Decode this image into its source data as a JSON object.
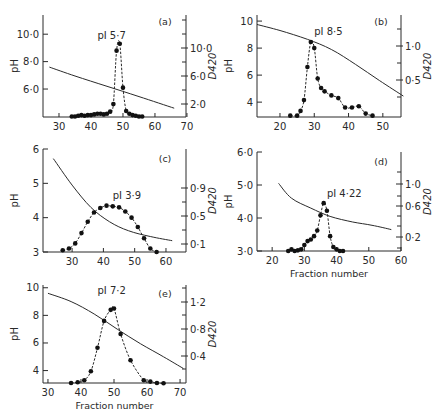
{
  "figure": {
    "background": "#ffffff",
    "ink": "#2a2a2a"
  },
  "chart_data": [
    {
      "type": "line",
      "panel": "(a)",
      "annotation": "pI 5·7",
      "xlabel": "",
      "ylabel": "pH",
      "ylabel_right": "D420",
      "x_ticks": [
        "30",
        "40",
        "50",
        "60",
        "70"
      ],
      "y_ticks": [
        "6·0",
        "8·0",
        "10·0"
      ],
      "y_right_ticks": [
        "2·0",
        "6·0",
        "10·0"
      ],
      "geom": {
        "left": 43,
        "right": 186,
        "top": 15,
        "bottom": 117,
        "x0": 25,
        "x1": 69.7,
        "y0": 3.96,
        "y1": 11.4
      },
      "x_tick_values": [
        30,
        40,
        50,
        60,
        70
      ],
      "y_tick_values": [
        6,
        8,
        10
      ],
      "y_right_tick_px": [
        104,
        76,
        48
      ],
      "y_right_minor_px": [
        90,
        62,
        34,
        20
      ],
      "pH_gradient": {
        "x": [
          27,
          35,
          45,
          55,
          66
        ],
        "y": [
          7.6,
          6.95,
          6.2,
          5.45,
          4.6
        ]
      },
      "absorbance": {
        "x": [
          34,
          35,
          36,
          37,
          38,
          39,
          40,
          41,
          42,
          43,
          44,
          45,
          46,
          47,
          48,
          49,
          50,
          51,
          52,
          53,
          54,
          55,
          56
        ],
        "y": [
          4.0,
          4.0,
          4.05,
          4.1,
          4.05,
          4.1,
          4.1,
          4.15,
          4.2,
          4.2,
          4.15,
          4.2,
          4.35,
          4.9,
          8.8,
          9.3,
          6.1,
          4.4,
          4.2,
          4.1,
          4.05,
          4.0,
          4.0
        ]
      },
      "label_pos": {
        "x": 42,
        "y": 9.65
      },
      "panel_label_pos": {
        "px": 165,
        "py": 25
      }
    },
    {
      "type": "line",
      "panel": "(b)",
      "annotation": "pI 8·5",
      "xlabel": "",
      "ylabel": "pH",
      "ylabel_right": "D420",
      "x_ticks": [
        "20",
        "30",
        "40",
        "50"
      ],
      "y_ticks": [
        "4",
        "6",
        "8",
        "10"
      ],
      "y_right_ticks": [
        "0·5",
        "1·0"
      ],
      "geom": {
        "left": 257,
        "right": 401,
        "top": 15,
        "bottom": 117,
        "x0": 13.3,
        "x1": 55.3,
        "y0": 2.9,
        "y1": 10.45
      },
      "x_tick_values": [
        20,
        30,
        40,
        50
      ],
      "y_tick_values": [
        4,
        6,
        8,
        10
      ],
      "y_right_tick_px": [
        80,
        46
      ],
      "y_right_minor_px": [
        97,
        63,
        29
      ],
      "pH_gradient": {
        "x": [
          13.3,
          20,
          28,
          35,
          42,
          49,
          56
        ],
        "y": [
          9.75,
          9.3,
          8.65,
          7.9,
          6.8,
          5.6,
          4.45
        ]
      },
      "absorbance": {
        "x": [
          23,
          25,
          26,
          27,
          28,
          29,
          30,
          31,
          32,
          33,
          35,
          37,
          39,
          41,
          43,
          45,
          47
        ],
        "y": [
          3.0,
          3.0,
          3.35,
          4.15,
          6.6,
          8.45,
          8.0,
          5.75,
          5.05,
          4.8,
          4.5,
          4.3,
          3.6,
          3.6,
          3.7,
          3.15,
          3.0
        ]
      },
      "label_pos": {
        "x": 30,
        "y": 9.0
      },
      "panel_label_pos": {
        "px": 381,
        "py": 25
      }
    },
    {
      "type": "line",
      "panel": "(c)",
      "annotation": "pI 3·9",
      "xlabel": "",
      "ylabel": "pH",
      "ylabel_right": "D420",
      "x_ticks": [
        "30",
        "40",
        "50",
        "60"
      ],
      "y_ticks": [
        "3",
        "4",
        "5",
        "6"
      ],
      "y_right_ticks": [
        "0·1",
        "0·5",
        "0·9"
      ],
      "geom": {
        "left": 43,
        "right": 186,
        "top": 149,
        "bottom": 252,
        "x0": 20.7,
        "x1": 66.4,
        "y0": 3.0,
        "y1": 6.0
      },
      "x_tick_values": [
        30,
        40,
        50,
        60
      ],
      "y_tick_values": [
        3,
        4,
        5,
        6
      ],
      "y_right_tick_px": [
        244,
        216,
        188
      ],
      "y_right_minor_px": [
        230,
        202
      ],
      "pH_gradient": {
        "x": [
          24,
          30,
          36,
          42,
          48,
          55,
          62
        ],
        "y": [
          5.72,
          4.95,
          4.3,
          3.88,
          3.62,
          3.45,
          3.33
        ]
      },
      "absorbance": {
        "x": [
          27,
          29,
          31,
          33,
          35,
          37,
          39,
          41,
          43,
          45,
          47,
          49,
          51,
          53,
          55,
          57
        ],
        "y": [
          3.05,
          3.1,
          3.25,
          3.55,
          3.88,
          4.15,
          4.28,
          4.35,
          4.33,
          4.3,
          4.18,
          4.0,
          3.73,
          3.4,
          3.1,
          3.0
        ]
      },
      "label_pos": {
        "x": 43,
        "y": 4.55
      },
      "panel_label_pos": {
        "px": 165,
        "py": 162
      }
    },
    {
      "type": "line",
      "panel": "(d)",
      "annotation": "pI 4·22",
      "xlabel": "Fraction number",
      "ylabel": "pH",
      "ylabel_right": "D420",
      "x_ticks": [
        "20",
        "30",
        "40",
        "50",
        "60"
      ],
      "y_ticks": [
        "3·0",
        "4·0",
        "5·0",
        "6·0"
      ],
      "y_right_ticks": [
        "0·2",
        "0·6",
        "1·0"
      ],
      "geom": {
        "left": 257,
        "right": 401,
        "top": 152,
        "bottom": 251,
        "x0": 15.3,
        "x1": 60,
        "y0": 3.0,
        "y1": 6.0
      },
      "x_tick_values": [
        20,
        30,
        40,
        50,
        60
      ],
      "y_tick_values": [
        3,
        4,
        5,
        6
      ],
      "y_right_tick_px": [
        237,
        206,
        184
      ],
      "y_right_minor_px": [
        248,
        226,
        216,
        196,
        172
      ],
      "pH_gradient": {
        "x": [
          22,
          26,
          32,
          38,
          45,
          51,
          57
        ],
        "y": [
          5.05,
          4.6,
          4.3,
          4.05,
          3.88,
          3.78,
          3.65
        ]
      },
      "absorbance": {
        "x": [
          25,
          26,
          27,
          28,
          29,
          30,
          31,
          32,
          33,
          34,
          35,
          36,
          37,
          38,
          39,
          40,
          41,
          42
        ],
        "y": [
          3.0,
          3.05,
          3.0,
          3.02,
          3.05,
          3.18,
          3.3,
          3.35,
          3.45,
          3.62,
          4.08,
          4.45,
          4.22,
          3.45,
          3.12,
          3.05,
          3.0,
          3.0
        ]
      },
      "label_pos": {
        "x": 37,
        "y": 4.65
      },
      "panel_label_pos": {
        "px": 381,
        "py": 165
      }
    },
    {
      "type": "line",
      "panel": "(e)",
      "annotation": "pI 7·2",
      "xlabel": "Fraction number",
      "ylabel": "pH",
      "ylabel_right": "D420",
      "x_ticks": [
        "30",
        "40",
        "50",
        "60",
        "70"
      ],
      "y_ticks": [
        "4",
        "6",
        "8",
        "10"
      ],
      "y_right_ticks": [
        "0·4",
        "0·8",
        "1·2"
      ],
      "geom": {
        "left": 43,
        "right": 186,
        "top": 285,
        "bottom": 383,
        "x0": 28.5,
        "x1": 71.8,
        "y0": 3.1,
        "y1": 10.2
      },
      "x_tick_values": [
        30,
        40,
        50,
        60,
        70
      ],
      "y_tick_values": [
        4,
        6,
        8,
        10
      ],
      "y_right_tick_px": [
        356,
        329,
        302
      ],
      "y_right_minor_px": [
        369,
        342,
        315,
        288
      ],
      "pH_gradient": {
        "x": [
          30,
          37,
          44,
          51,
          58,
          65,
          71
        ],
        "y": [
          9.6,
          9.0,
          8.1,
          7.0,
          5.95,
          5.0,
          4.15
        ]
      },
      "absorbance": {
        "x": [
          37,
          39,
          41,
          43,
          45,
          47,
          49,
          50,
          52,
          55,
          59,
          61,
          63,
          65
        ],
        "y": [
          3.1,
          3.15,
          3.3,
          3.95,
          5.65,
          7.6,
          8.4,
          8.5,
          6.65,
          4.75,
          3.3,
          3.2,
          3.1,
          3.08
        ]
      },
      "label_pos": {
        "x": 45,
        "y": 9.55
      },
      "panel_label_pos": {
        "px": 165,
        "py": 297
      }
    }
  ]
}
